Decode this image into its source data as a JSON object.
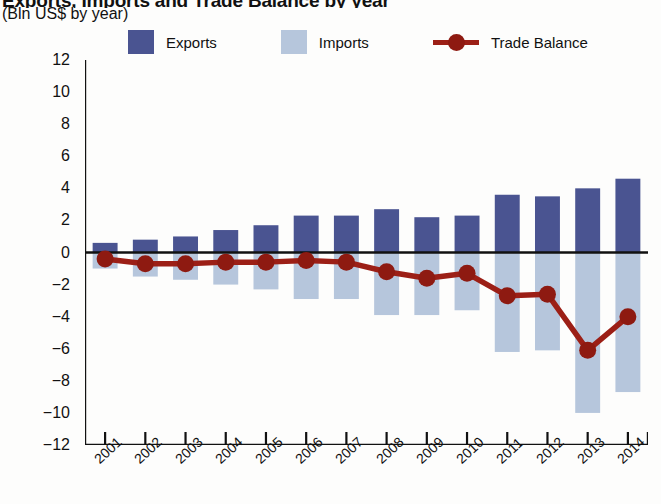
{
  "title": "Exports, Imports and Trade Balance by year",
  "subtitle": "(Bln US$ by year)",
  "legend": {
    "exports": "Exports",
    "imports": "Imports",
    "balance": "Trade Balance"
  },
  "colors": {
    "exports": "#4a5491",
    "imports": "#b6c6dc",
    "balance": "#9c1f16",
    "balance_marker": "#8e1a11",
    "axis": "#111111",
    "background": "#fdfdfc"
  },
  "chart_data": {
    "type": "bar",
    "title": "Exports, Imports and Trade Balance by year",
    "subtitle": "(Bln US$ by year)",
    "xlabel": "",
    "ylabel": "Bln US$",
    "ylim": [
      -12,
      12
    ],
    "ytick_step": 2,
    "yticks": [
      "12",
      "10",
      "8",
      "6",
      "4",
      "2",
      "0",
      "-2",
      "-4",
      "-6",
      "-8",
      "-10",
      "-12"
    ],
    "grid": false,
    "legend_position": "top",
    "categories": [
      "2001",
      "2002",
      "2003",
      "2004",
      "2005",
      "2006",
      "2007",
      "2008",
      "2009",
      "2010",
      "2011",
      "2012",
      "2013",
      "2014"
    ],
    "series": [
      {
        "name": "Exports",
        "type": "bar",
        "values": [
          0.6,
          0.8,
          1.0,
          1.4,
          1.7,
          2.3,
          2.3,
          2.7,
          2.2,
          2.3,
          3.6,
          3.5,
          4.0,
          4.6
        ]
      },
      {
        "name": "Imports",
        "type": "bar",
        "values": [
          -1.0,
          -1.5,
          -1.7,
          -2.0,
          -2.3,
          -2.9,
          -2.9,
          -3.9,
          -3.9,
          -3.6,
          -6.2,
          -6.1,
          -10.0,
          -8.7
        ]
      },
      {
        "name": "Trade Balance",
        "type": "line",
        "values": [
          -0.4,
          -0.7,
          -0.7,
          -0.6,
          -0.6,
          -0.5,
          -0.6,
          -1.2,
          -1.6,
          -1.3,
          -2.7,
          -2.6,
          -6.1,
          -4.0
        ]
      }
    ]
  }
}
